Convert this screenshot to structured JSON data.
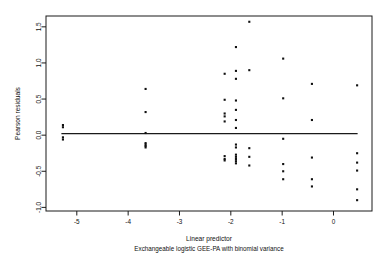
{
  "chart_data": {
    "type": "scatter",
    "title": "",
    "xlabel": "Linear predictor",
    "sublabel": "Exchangeable logistic GEE-PA with binomial variance",
    "ylabel": "Pearson residuals",
    "xlim": [
      -5.6,
      0.75
    ],
    "ylim": [
      -1.05,
      1.65
    ],
    "xticks": [
      "-5",
      "-4",
      "-3",
      "-2",
      "-1",
      "0"
    ],
    "xtickvals": [
      -5,
      -4,
      -3,
      -2,
      -1,
      0
    ],
    "yticks": [
      "-1.0",
      "-0.5",
      "0.0",
      "0.5",
      "1.0",
      "1.5"
    ],
    "ytickvals": [
      -1.0,
      -0.5,
      0.0,
      0.5,
      1.0,
      1.5
    ],
    "grid": false,
    "legend": "none",
    "reference_line": {
      "y": 0.02,
      "x_start": -5.3,
      "x_end": 0.47
    },
    "marker": "square",
    "marker_size": 2.1,
    "points": [
      [
        -5.27,
        0.14
      ],
      [
        -5.27,
        0.11
      ],
      [
        -5.27,
        -0.03
      ],
      [
        -5.27,
        -0.06
      ],
      [
        -3.66,
        0.64
      ],
      [
        -3.66,
        0.32
      ],
      [
        -3.66,
        0.03
      ],
      [
        -3.66,
        -0.11
      ],
      [
        -3.66,
        -0.13
      ],
      [
        -3.66,
        -0.15
      ],
      [
        -3.66,
        -0.17
      ],
      [
        -2.12,
        0.85
      ],
      [
        -2.12,
        0.49
      ],
      [
        -2.12,
        0.3
      ],
      [
        -2.12,
        0.26
      ],
      [
        -2.12,
        0.19
      ],
      [
        -2.12,
        -0.29
      ],
      [
        -2.12,
        -0.33
      ],
      [
        -2.12,
        -0.35
      ],
      [
        -1.9,
        1.22
      ],
      [
        -1.9,
        0.89
      ],
      [
        -1.9,
        0.78
      ],
      [
        -1.9,
        0.48
      ],
      [
        -1.9,
        0.35
      ],
      [
        -1.9,
        0.21
      ],
      [
        -1.9,
        0.1
      ],
      [
        -1.9,
        -0.13
      ],
      [
        -1.9,
        -0.17
      ],
      [
        -1.9,
        -0.27
      ],
      [
        -1.9,
        -0.3
      ],
      [
        -1.9,
        -0.33
      ],
      [
        -1.9,
        -0.36
      ],
      [
        -1.9,
        -0.39
      ],
      [
        -1.64,
        1.57
      ],
      [
        -1.64,
        0.9
      ],
      [
        -1.64,
        -0.18
      ],
      [
        -1.64,
        -0.3
      ],
      [
        -1.64,
        -0.42
      ],
      [
        -0.98,
        1.06
      ],
      [
        -0.98,
        0.51
      ],
      [
        -0.98,
        -0.05
      ],
      [
        -0.98,
        -0.4
      ],
      [
        -0.98,
        -0.5
      ],
      [
        -0.98,
        -0.61
      ],
      [
        -0.42,
        0.71
      ],
      [
        -0.42,
        0.21
      ],
      [
        -0.42,
        -0.31
      ],
      [
        -0.42,
        -0.61
      ],
      [
        -0.42,
        -0.71
      ],
      [
        0.46,
        0.69
      ],
      [
        0.46,
        -0.25
      ],
      [
        0.46,
        -0.38
      ],
      [
        0.46,
        -0.49
      ],
      [
        0.46,
        -0.75
      ],
      [
        0.46,
        -0.9
      ]
    ]
  }
}
